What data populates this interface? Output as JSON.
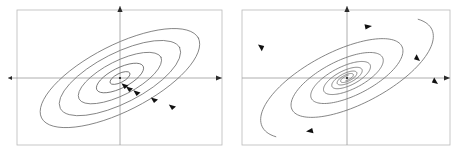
{
  "figure": {
    "title": "",
    "background_color": "#ffffff",
    "width": 464,
    "height": 159
  },
  "panels": [
    {
      "id": "left-panel",
      "name": "center-phase-portrait",
      "classification_label": "",
      "frame": {
        "x": 17,
        "y": 10,
        "width": 205,
        "height": 135
      },
      "axes": {
        "x_axis_y": 78,
        "y_axis_x": 120,
        "x_arrow_direction": "right",
        "y_arrow_direction": "up",
        "axis_color": "#9a9a9a"
      },
      "orbit_style": "closed nested ellipses",
      "flow_direction": "clockwise",
      "ellipse_tilt_deg": -27,
      "orbits": [
        {
          "rx": 88,
          "ry": 33
        },
        {
          "rx": 67,
          "ry": 25
        },
        {
          "rx": 46,
          "ry": 17
        },
        {
          "rx": 26,
          "ry": 10
        },
        {
          "rx": 11,
          "ry": 4.5
        }
      ],
      "arrow_count": 5,
      "equilibrium": {
        "x": 120,
        "y": 78,
        "type": "center"
      }
    },
    {
      "id": "right-panel",
      "name": "spiral-sink-phase-portrait",
      "classification_label": "",
      "frame": {
        "x": 242,
        "y": 10,
        "width": 208,
        "height": 135
      },
      "axes": {
        "x_axis_y": 78,
        "y_axis_x": 347,
        "x_arrow_direction": "right",
        "y_arrow_direction": "up",
        "axis_color": "#9a9a9a"
      },
      "orbit_style": "inward logarithmic spiral",
      "flow_direction": "clockwise inward",
      "ellipse_tilt_deg": -27,
      "spiral": {
        "start_radius": 1.0,
        "decay_per_turn": 0.42,
        "turns": 3.4,
        "aspect_ratio": 0.38,
        "max_rx": 104,
        "max_ry": 40
      },
      "arrow_count": 5,
      "equilibrium": {
        "x": 347,
        "y": 78,
        "type": "spiral-sink"
      }
    }
  ],
  "colors": {
    "frame": "#b9b9b9",
    "axis": "#9a9a9a",
    "orbit": "#6e6e6e",
    "arrow": "#111111",
    "background": "#ffffff"
  },
  "chart_data": {
    "type": "line",
    "title": "",
    "xlabel": "",
    "ylabel": "",
    "subplots": [
      {
        "name": "center",
        "description": "Nested tilted closed ellipses around an equilibrium at the origin; trajectories traverse clockwise; neither approach nor leave the origin.",
        "series": [
          {
            "name": "orbit-1",
            "semi_major": 88,
            "semi_minor": 33,
            "tilt_deg": -27
          },
          {
            "name": "orbit-2",
            "semi_major": 67,
            "semi_minor": 25,
            "tilt_deg": -27
          },
          {
            "name": "orbit-3",
            "semi_major": 46,
            "semi_minor": 17,
            "tilt_deg": -27
          },
          {
            "name": "orbit-4",
            "semi_major": 26,
            "semi_minor": 10,
            "tilt_deg": -27
          },
          {
            "name": "orbit-5",
            "semi_major": 11,
            "semi_minor": 4.5,
            "tilt_deg": -27
          }
        ]
      },
      {
        "name": "spiral-sink",
        "description": "Trajectories spiral clockwise inward toward the equilibrium at the origin along a tilted elliptical logarithmic spiral.",
        "series": [
          {
            "name": "spiral-A",
            "turns": 3.4,
            "decay_per_turn": 0.42,
            "start_angle_deg": 150
          },
          {
            "name": "spiral-B",
            "turns": 3.4,
            "decay_per_turn": 0.42,
            "start_angle_deg": 330
          }
        ]
      }
    ],
    "grid": false,
    "legend": "none"
  }
}
